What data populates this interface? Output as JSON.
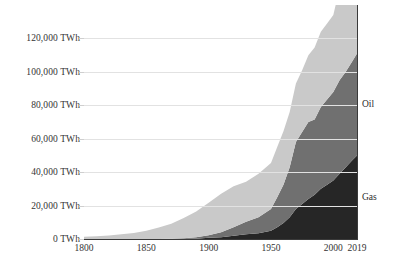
{
  "chart_data": {
    "type": "area",
    "stacked": true,
    "title": "",
    "subtitle": "",
    "xlabel": "",
    "ylabel": "",
    "xlim": [
      1800,
      2019
    ],
    "ylim": [
      0,
      140000
    ],
    "grid": true,
    "legend_position": "right-inline",
    "y_tick_labels": [
      "0 TWh",
      "20,000 TWh",
      "40,000 TWh",
      "60,000 TWh",
      "80,000 TWh",
      "100,000 TWh",
      "120,000 TWh"
    ],
    "y_tick_values": [
      0,
      20000,
      40000,
      60000,
      80000,
      100000,
      120000
    ],
    "x_tick_labels": [
      "1800",
      "1850",
      "1900",
      "1950",
      "2000",
      "2019"
    ],
    "x_tick_values": [
      1800,
      1850,
      1900,
      1950,
      2000,
      2019
    ],
    "colors": {
      "coal": "#c9c9c9",
      "oil": "#707070",
      "gas": "#262626",
      "gridline": "#e2e2e2",
      "axis": "#3a3a3a",
      "text": "#2b2b2b",
      "background": "#ffffff"
    },
    "x": [
      1800,
      1810,
      1820,
      1830,
      1840,
      1850,
      1860,
      1870,
      1880,
      1890,
      1900,
      1910,
      1920,
      1930,
      1940,
      1950,
      1955,
      1960,
      1965,
      1970,
      1975,
      1980,
      1985,
      1990,
      1995,
      2000,
      2005,
      2010,
      2015,
      2019
    ],
    "series": [
      {
        "name": "Gas",
        "order": 0,
        "label": "Gas",
        "color": "#262626",
        "values": [
          0,
          0,
          0,
          0,
          0,
          0,
          0,
          0,
          100,
          200,
          700,
          1100,
          2000,
          2800,
          3500,
          5000,
          7000,
          9500,
          13000,
          18000,
          21000,
          24000,
          26500,
          30000,
          32500,
          35000,
          39000,
          43000,
          47000,
          50000
        ]
      },
      {
        "name": "Oil",
        "order": 1,
        "label": "Oil",
        "color": "#707070",
        "values": [
          0,
          0,
          0,
          0,
          0,
          0,
          50,
          150,
          400,
          800,
          1500,
          3000,
          5000,
          7500,
          9500,
          13000,
          18000,
          23000,
          30000,
          40000,
          43000,
          46000,
          45000,
          49000,
          51000,
          53000,
          56000,
          57000,
          59000,
          61000
        ]
      },
      {
        "name": "Coal",
        "order": 2,
        "label": "Coal",
        "color": "#c9c9c9",
        "values": [
          1300,
          1700,
          2100,
          2800,
          3600,
          5000,
          6800,
          9000,
          12000,
          15500,
          19500,
          23000,
          24500,
          24000,
          26000,
          27500,
          30000,
          32000,
          33000,
          35000,
          37000,
          40000,
          43000,
          45000,
          45500,
          46000,
          55000,
          63000,
          67000,
          68000
        ]
      }
    ],
    "totals_note": ""
  }
}
